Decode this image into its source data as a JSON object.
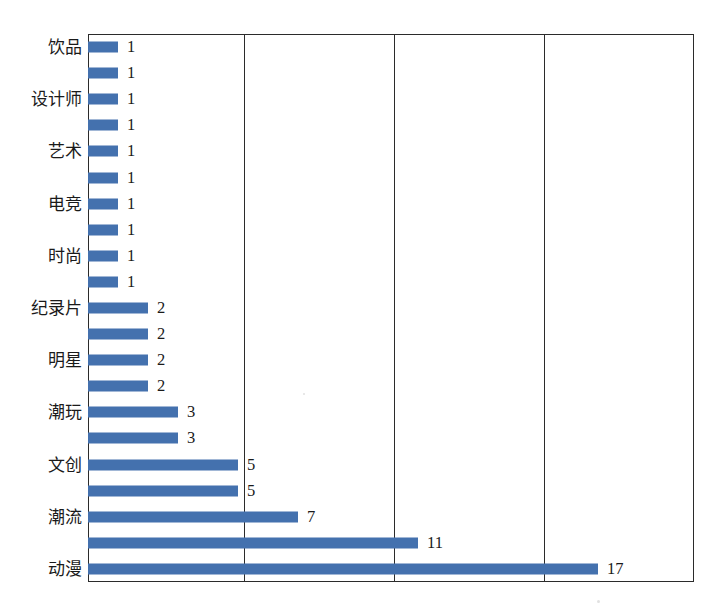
{
  "chart_data": {
    "type": "bar",
    "orientation": "horizontal",
    "title": "",
    "subtitle": "",
    "xlabel": "",
    "ylabel": "",
    "xlim": [
      0,
      19.5
    ],
    "ylim": null,
    "grid": true,
    "grid_axis": "x",
    "gridline_values": [
      5,
      10,
      15
    ],
    "legend": false,
    "legend_position": "none",
    "show_value_labels": true,
    "bar_color": "#4471ae",
    "axis_color": "#2b2b2b",
    "categories": [
      "饱品",
      "",
      "设计师",
      "",
      "艺术",
      "",
      "电竞",
      "",
      "时尚",
      "",
      "纪录片",
      "",
      "明星",
      "",
      "潮玩",
      "",
      "文创",
      "",
      "潮流",
      "",
      "动漫"
    ],
    "values": [
      1,
      1,
      1,
      1,
      1,
      1,
      1,
      1,
      1,
      1,
      2,
      2,
      2,
      2,
      3,
      3,
      5,
      5,
      7,
      11,
      17
    ],
    "value_labels": [
      "1",
      "1",
      "1",
      "1",
      "1",
      "1",
      "1",
      "1",
      "1",
      "1",
      "2",
      "2",
      "2",
      "2",
      "3",
      "3",
      "5",
      "5",
      "7",
      "11",
      "17"
    ],
    "visible_category_labels": [
      "饮品",
      "设计师",
      "艺术",
      "电竞",
      "时尚",
      "纪录片",
      "明星",
      "潮玩",
      "文创",
      "潮流",
      "动漫"
    ],
    "bars": [
      {
        "label": "饮品",
        "value": 1,
        "value_label": "1",
        "show_label": true
      },
      {
        "label": "",
        "value": 1,
        "value_label": "1",
        "show_label": false
      },
      {
        "label": "设计师",
        "value": 1,
        "value_label": "1",
        "show_label": true
      },
      {
        "label": "",
        "value": 1,
        "value_label": "1",
        "show_label": false
      },
      {
        "label": "艺术",
        "value": 1,
        "value_label": "1",
        "show_label": true
      },
      {
        "label": "",
        "value": 1,
        "value_label": "1",
        "show_label": false
      },
      {
        "label": "电竞",
        "value": 1,
        "value_label": "1",
        "show_label": true
      },
      {
        "label": "",
        "value": 1,
        "value_label": "1",
        "show_label": false
      },
      {
        "label": "时尚",
        "value": 1,
        "value_label": "1",
        "show_label": true
      },
      {
        "label": "",
        "value": 1,
        "value_label": "1",
        "show_label": false
      },
      {
        "label": "纪录片",
        "value": 2,
        "value_label": "2",
        "show_label": true
      },
      {
        "label": "",
        "value": 2,
        "value_label": "2",
        "show_label": false
      },
      {
        "label": "明星",
        "value": 2,
        "value_label": "2",
        "show_label": true
      },
      {
        "label": "",
        "value": 2,
        "value_label": "2",
        "show_label": false
      },
      {
        "label": "潮玩",
        "value": 3,
        "value_label": "3",
        "show_label": true
      },
      {
        "label": "",
        "value": 3,
        "value_label": "3",
        "show_label": false
      },
      {
        "label": "文创",
        "value": 5,
        "value_label": "5",
        "show_label": true
      },
      {
        "label": "",
        "value": 5,
        "value_label": "5",
        "show_label": false
      },
      {
        "label": "潮流",
        "value": 7,
        "value_label": "7",
        "show_label": true
      },
      {
        "label": "",
        "value": 11,
        "value_label": "11",
        "show_label": false
      },
      {
        "label": "动漫",
        "value": 17,
        "value_label": "17",
        "show_label": true
      }
    ]
  }
}
